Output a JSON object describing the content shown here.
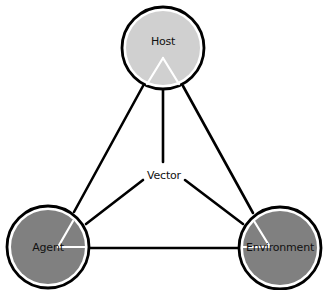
{
  "diagram": {
    "title": "",
    "nodes": [
      {
        "id": "host",
        "label": "Host",
        "fill": "#d0d0d0"
      },
      {
        "id": "agent",
        "label": "Agent",
        "fill": "#808080"
      },
      {
        "id": "environment",
        "label": "Environment",
        "fill": "#808080"
      }
    ],
    "center": {
      "id": "vector",
      "label": "Vector"
    },
    "edges": [
      {
        "from": "host",
        "to": "agent"
      },
      {
        "from": "host",
        "to": "environment"
      },
      {
        "from": "agent",
        "to": "environment"
      },
      {
        "from": "host",
        "to": "vector"
      },
      {
        "from": "vector",
        "to": "agent"
      },
      {
        "from": "vector",
        "to": "environment"
      }
    ],
    "colors": {
      "stroke": "#000000",
      "host_fill": "#d0d0d0",
      "agent_fill": "#808080",
      "environment_fill": "#808080",
      "wedge_line": "#ffffff"
    }
  }
}
